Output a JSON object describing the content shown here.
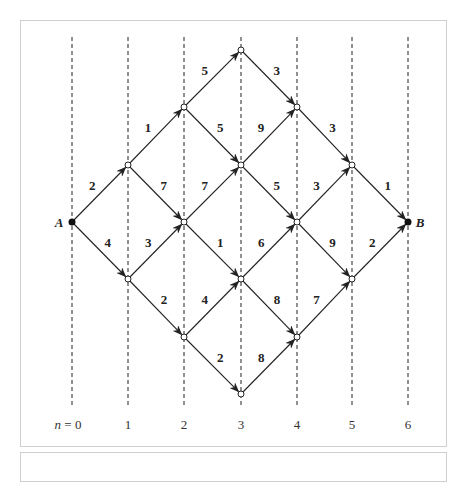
{
  "diagram": {
    "start_label": "A",
    "end_label": "B",
    "axis_prefix": "n = ",
    "stages": [
      "0",
      "1",
      "2",
      "3",
      "4",
      "5",
      "6"
    ],
    "edges": [
      {
        "from": "A",
        "to": "1u",
        "weight": "2"
      },
      {
        "from": "A",
        "to": "1d",
        "weight": "4"
      },
      {
        "from": "1u",
        "to": "2u",
        "weight": "1"
      },
      {
        "from": "1u",
        "to": "2m",
        "weight": "7"
      },
      {
        "from": "1d",
        "to": "2m",
        "weight": "3"
      },
      {
        "from": "1d",
        "to": "2d",
        "weight": "2"
      },
      {
        "from": "2u",
        "to": "3t",
        "weight": "5"
      },
      {
        "from": "2u",
        "to": "3u",
        "weight": "5"
      },
      {
        "from": "2m",
        "to": "3u",
        "weight": "7"
      },
      {
        "from": "2m",
        "to": "3d",
        "weight": "1"
      },
      {
        "from": "2d",
        "to": "3d",
        "weight": "4"
      },
      {
        "from": "2d",
        "to": "3b",
        "weight": "2"
      },
      {
        "from": "3t",
        "to": "4u",
        "weight": "3"
      },
      {
        "from": "3u",
        "to": "4u",
        "weight": "9"
      },
      {
        "from": "3u",
        "to": "4m",
        "weight": "5"
      },
      {
        "from": "3d",
        "to": "4m",
        "weight": "6"
      },
      {
        "from": "3d",
        "to": "4d",
        "weight": "8"
      },
      {
        "from": "3b",
        "to": "4d",
        "weight": "8"
      },
      {
        "from": "4u",
        "to": "5u",
        "weight": "3"
      },
      {
        "from": "4m",
        "to": "5u",
        "weight": "3"
      },
      {
        "from": "4m",
        "to": "5d",
        "weight": "9"
      },
      {
        "from": "4d",
        "to": "5d",
        "weight": "7"
      },
      {
        "from": "5u",
        "to": "B",
        "weight": "1"
      },
      {
        "from": "5d",
        "to": "B",
        "weight": "2"
      }
    ]
  }
}
